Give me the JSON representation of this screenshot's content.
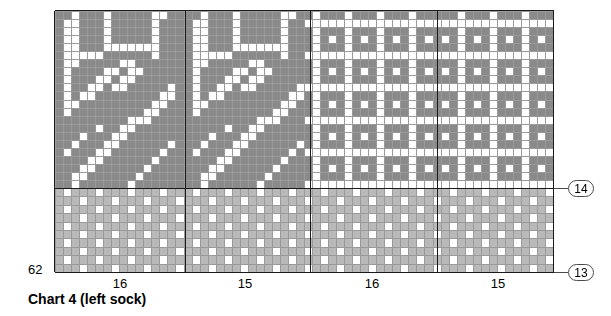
{
  "caption": "Chart 4 (left sock)",
  "colors": {
    "dark": "#8a8a8a",
    "light": "#b9b9b9",
    "blank": "#ffffff",
    "gridline": "#9a9a9a",
    "heavyline": "#1a1a1a",
    "badge_border": "#4a4a4a",
    "text": "#000000",
    "background": "#ffffff"
  },
  "row_labels": {
    "left_bottom": "62",
    "right_top": "14",
    "right_bottom": "13"
  },
  "column_labels": [
    {
      "text": "16",
      "section": 1
    },
    {
      "text": "15",
      "section": 2
    },
    {
      "text": "16",
      "section": 3
    },
    {
      "text": "15",
      "section": 4
    }
  ],
  "chart_data": {
    "type": "heatmap",
    "title": "Chart 4 (left sock)",
    "xlabel": "",
    "ylabel": "",
    "cell_size": 8.1,
    "columns": 62,
    "rows_upper": 22,
    "rows_lower": 10,
    "section_widths": [
      16,
      15,
      16,
      15
    ],
    "section_boundaries_px": [
      0,
      130,
      255,
      382,
      498
    ],
    "upper_band": {
      "rows": 22,
      "palette": [
        "#8a8a8a",
        "#ffffff"
      ],
      "note": "0 = dark grey stitch, 1 = white stitch",
      "motif_sections": [
        1,
        2
      ],
      "lattice_sections": [
        3,
        4
      ],
      "motif_width": 16,
      "motif": [
        "0010001000001100",
        "0110001000001000",
        "0110001000001000",
        "0110001000001000",
        "0110001111111000",
        "0111110000001000",
        "0110000011000000",
        "0100001101100000",
        "0100011011000000",
        "0100110110000010",
        "0101100000000110",
        "0110000000001100",
        "0100000000011000",
        "0000000001110000",
        "0000010011000000",
        "0001000110000000",
        "0010001100000010",
        "0100011000000100",
        "0000110000001000",
        "0001100000010000",
        "0011000000100000",
        "0010000001000000"
      ],
      "lattice_period": 4,
      "lattice_note": "Plaid lattice: white stitch every 4th column, white cross rows every 4th row, with isolated dark centres"
    },
    "lower_band": {
      "rows": 10,
      "palette": [
        "#b9b9b9",
        "#ffffff"
      ],
      "note": "0 = light grey stitch, 1 = white stitch",
      "pattern_period": 4,
      "pattern_description": "Repeating diamond/seeded plaid: white squares on a light grey ground, offset every other row"
    },
    "grid": true,
    "legend_position": "none"
  }
}
